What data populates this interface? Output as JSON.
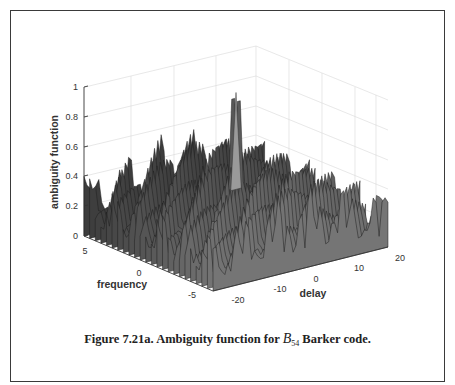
{
  "figure": {
    "caption_prefix": "Figure 7.21a. Ambiguity function for ",
    "caption_symbol": "B",
    "caption_subscript": "54",
    "caption_suffix": " Barker code."
  },
  "chart_data": {
    "type": "surface3d",
    "title": "",
    "zlabel": "ambiguity function",
    "xlabel": "delay",
    "ylabel": "frequency",
    "z_ticks": [
      "0",
      "0.2",
      "0.4",
      "0.6",
      "0.8",
      "1"
    ],
    "delay_ticks": [
      "-20",
      "-10",
      "0",
      "10",
      "20"
    ],
    "frequency_ticks": [
      "5",
      "0",
      "-5"
    ],
    "zlim": [
      0,
      1
    ],
    "delay_range": [
      -20,
      20
    ],
    "frequency_range": [
      -5,
      5
    ],
    "grid": true,
    "colormap": "gray mesh",
    "peak": {
      "delay": 0,
      "frequency": 0,
      "value": 1.0
    },
    "sidelobe_max_approx": 0.45,
    "edge_value_at_delay_-20_freq_5": 0.4,
    "edge_value_at_delay_20_freq_-5": 0.3,
    "series": [
      {
        "name": "back-ridge profile (approx heights along delay)",
        "delay": [
          -20,
          -18,
          -16,
          -14,
          -12,
          -10,
          -8,
          -6,
          -4,
          -2,
          0,
          2,
          4,
          6,
          8,
          10,
          12,
          14,
          16,
          18,
          20
        ],
        "values": [
          0.4,
          0.1,
          0.15,
          0.2,
          0.18,
          0.3,
          0.35,
          0.4,
          0.45,
          0.4,
          0.95,
          0.5,
          0.42,
          0.4,
          0.38,
          0.35,
          0.3,
          0.25,
          0.2,
          0.15,
          0.3
        ]
      }
    ]
  }
}
